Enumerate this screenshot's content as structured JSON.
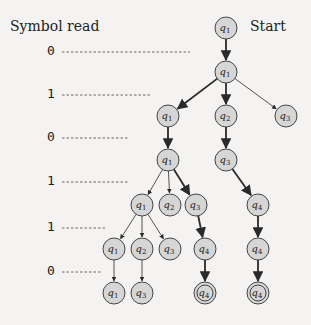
{
  "labels": {
    "symbol_read": "Symbol read",
    "start": "Start"
  },
  "symbols": [
    {
      "value": "0",
      "y": 52,
      "line_end": 190
    },
    {
      "value": "1",
      "y": 95,
      "line_end": 150
    },
    {
      "value": "0",
      "y": 138,
      "line_end": 128
    },
    {
      "value": "1",
      "y": 182,
      "line_end": 128
    },
    {
      "value": "1",
      "y": 228,
      "line_end": 107
    },
    {
      "value": "0",
      "y": 272,
      "line_end": 102
    }
  ],
  "colors": {
    "node_fill": "#d6d6d6",
    "node_stroke": "#333333",
    "edge": "#2a2a2a",
    "background": "#f4f3f1"
  },
  "nodes": [
    {
      "id": "n0",
      "label": "q",
      "sub": "1",
      "x": 226,
      "y": 28,
      "accept": false
    },
    {
      "id": "n1",
      "label": "q",
      "sub": "1",
      "x": 226,
      "y": 72,
      "accept": false
    },
    {
      "id": "n2",
      "label": "q",
      "sub": "1",
      "x": 168,
      "y": 116,
      "accept": false
    },
    {
      "id": "n3",
      "label": "q",
      "sub": "2",
      "x": 226,
      "y": 116,
      "accept": false
    },
    {
      "id": "n4",
      "label": "q",
      "sub": "3",
      "x": 286,
      "y": 116,
      "accept": false
    },
    {
      "id": "n5",
      "label": "q",
      "sub": "1",
      "x": 168,
      "y": 160,
      "accept": false
    },
    {
      "id": "n6",
      "label": "q",
      "sub": "3",
      "x": 226,
      "y": 160,
      "accept": false
    },
    {
      "id": "n7",
      "label": "q",
      "sub": "1",
      "x": 142,
      "y": 205,
      "accept": false
    },
    {
      "id": "n8",
      "label": "q",
      "sub": "2",
      "x": 170,
      "y": 205,
      "accept": false
    },
    {
      "id": "n9",
      "label": "q",
      "sub": "3",
      "x": 196,
      "y": 205,
      "accept": false
    },
    {
      "id": "n10",
      "label": "q",
      "sub": "4",
      "x": 258,
      "y": 205,
      "accept": false
    },
    {
      "id": "n11",
      "label": "q",
      "sub": "1",
      "x": 114,
      "y": 249,
      "accept": false
    },
    {
      "id": "n12",
      "label": "q",
      "sub": "2",
      "x": 142,
      "y": 249,
      "accept": false
    },
    {
      "id": "n13",
      "label": "q",
      "sub": "3",
      "x": 170,
      "y": 249,
      "accept": false
    },
    {
      "id": "n14",
      "label": "q",
      "sub": "4",
      "x": 205,
      "y": 249,
      "accept": false
    },
    {
      "id": "n15",
      "label": "q",
      "sub": "4",
      "x": 258,
      "y": 249,
      "accept": false
    },
    {
      "id": "n16",
      "label": "q",
      "sub": "1",
      "x": 114,
      "y": 293,
      "accept": false
    },
    {
      "id": "n17",
      "label": "q",
      "sub": "3",
      "x": 142,
      "y": 293,
      "accept": false
    },
    {
      "id": "n18",
      "label": "q",
      "sub": "4",
      "x": 205,
      "y": 293,
      "accept": true
    },
    {
      "id": "n19",
      "label": "q",
      "sub": "4",
      "x": 258,
      "y": 293,
      "accept": true
    }
  ],
  "edges": [
    {
      "from": "n0",
      "to": "n1",
      "bold": true
    },
    {
      "from": "n1",
      "to": "n2",
      "bold": true
    },
    {
      "from": "n1",
      "to": "n3",
      "bold": true
    },
    {
      "from": "n1",
      "to": "n4",
      "bold": false
    },
    {
      "from": "n2",
      "to": "n5",
      "bold": true
    },
    {
      "from": "n3",
      "to": "n6",
      "bold": true
    },
    {
      "from": "n5",
      "to": "n7",
      "bold": false
    },
    {
      "from": "n5",
      "to": "n8",
      "bold": false
    },
    {
      "from": "n5",
      "to": "n9",
      "bold": true
    },
    {
      "from": "n6",
      "to": "n10",
      "bold": true
    },
    {
      "from": "n7",
      "to": "n11",
      "bold": false
    },
    {
      "from": "n7",
      "to": "n12",
      "bold": false
    },
    {
      "from": "n7",
      "to": "n13",
      "bold": false
    },
    {
      "from": "n9",
      "to": "n14",
      "bold": true
    },
    {
      "from": "n10",
      "to": "n15",
      "bold": true
    },
    {
      "from": "n11",
      "to": "n16",
      "bold": false
    },
    {
      "from": "n12",
      "to": "n17",
      "bold": false
    },
    {
      "from": "n14",
      "to": "n18",
      "bold": true
    },
    {
      "from": "n15",
      "to": "n19",
      "bold": true
    }
  ]
}
